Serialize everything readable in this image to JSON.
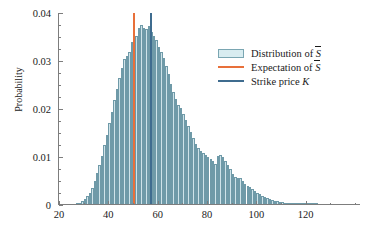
{
  "chart_data": {
    "type": "bar",
    "title": "",
    "subtitle": "",
    "xlabel": "",
    "ylabel": "Probability",
    "xlim": [
      20,
      142
    ],
    "ylim": [
      0,
      0.04
    ],
    "grid": false,
    "legend_position": "upper-right",
    "x_ticks": [
      20,
      40,
      60,
      80,
      100,
      120
    ],
    "x_tick_labels": [
      "20",
      "40",
      "60",
      "80",
      "100",
      "120"
    ],
    "x_minor_ticks": [
      30,
      50,
      70,
      90,
      110,
      130,
      140
    ],
    "y_ticks": [
      0,
      0.01,
      0.02,
      0.03,
      0.04
    ],
    "y_tick_labels": [
      "0",
      "0.01",
      "0.02",
      "0.03",
      "0.04"
    ],
    "y_minor_ticks": [
      0.0025,
      0.005,
      0.0075,
      0.0125,
      0.015,
      0.0175,
      0.0225,
      0.025,
      0.0275,
      0.0325,
      0.035,
      0.0375
    ],
    "bin_width": 1,
    "bin_starts": [
      27,
      28,
      29,
      30,
      31,
      32,
      33,
      34,
      35,
      36,
      37,
      38,
      39,
      40,
      41,
      42,
      43,
      44,
      45,
      46,
      47,
      48,
      49,
      50,
      51,
      52,
      53,
      54,
      55,
      56,
      57,
      58,
      59,
      60,
      61,
      62,
      63,
      64,
      65,
      66,
      67,
      68,
      69,
      70,
      71,
      72,
      73,
      74,
      75,
      76,
      77,
      78,
      79,
      80,
      81,
      82,
      83,
      84,
      85,
      86,
      87,
      88,
      89,
      90,
      91,
      92,
      93,
      94,
      95,
      96,
      97,
      98,
      99,
      100,
      101,
      102,
      103,
      104,
      105,
      106,
      107,
      108,
      109,
      110,
      111,
      112,
      113,
      114,
      115,
      116,
      117,
      118,
      119,
      120,
      121,
      122,
      123,
      124
    ],
    "values": [
      0.0003,
      0.0005,
      0.0008,
      0.0012,
      0.0018,
      0.0026,
      0.0036,
      0.005,
      0.0066,
      0.0083,
      0.0103,
      0.0124,
      0.0146,
      0.017,
      0.0194,
      0.0218,
      0.0242,
      0.0265,
      0.0286,
      0.0305,
      0.0311,
      0.0319,
      0.034,
      0.0332,
      0.0353,
      0.0369,
      0.0374,
      0.0369,
      0.0366,
      0.0373,
      0.036,
      0.0353,
      0.0344,
      0.033,
      0.0318,
      0.0306,
      0.029,
      0.0272,
      0.0253,
      0.0235,
      0.022,
      0.0208,
      0.0202,
      0.019,
      0.0177,
      0.0165,
      0.0152,
      0.014,
      0.0128,
      0.0119,
      0.0113,
      0.0108,
      0.0104,
      0.0101,
      0.0096,
      0.0091,
      0.0086,
      0.0102,
      0.0105,
      0.01,
      0.0092,
      0.0083,
      0.0074,
      0.0065,
      0.0058,
      0.0057,
      0.0056,
      0.005,
      0.0044,
      0.004,
      0.0037,
      0.0033,
      0.0029,
      0.0026,
      0.0022,
      0.0019,
      0.0017,
      0.0014,
      0.0012,
      0.001,
      0.0009,
      0.0008,
      0.0007,
      0.0006,
      0.0005,
      0.0004,
      0.0004,
      0.0003,
      0.0003,
      0.0002,
      0.0002,
      0.0002,
      0.0001,
      0.0001,
      0.0001,
      0.0001
    ],
    "markers": [
      {
        "name": "expectation",
        "x": 49.8,
        "color": "#e8703a"
      },
      {
        "name": "strike",
        "x": 57.0,
        "color": "#3f6c8f"
      }
    ],
    "legend": [
      {
        "key": "box",
        "label_prefix": "Distribution of ",
        "symbol": "S",
        "symbol_overbar": true,
        "label_suffix": "",
        "color": "#d8ecf0"
      },
      {
        "key": "line",
        "label_prefix": "Expectation of ",
        "symbol": "S",
        "symbol_overbar": true,
        "label_suffix": "",
        "color": "#e8703a"
      },
      {
        "key": "line",
        "label_prefix": "Strike price ",
        "symbol": "K",
        "symbol_overbar": false,
        "label_suffix": "",
        "color": "#3f6c8f"
      }
    ],
    "bar_fill_color": "#cfe3e9",
    "bar_edge_color": "#6f9aa8",
    "axis_color": "#7d7d7d"
  }
}
